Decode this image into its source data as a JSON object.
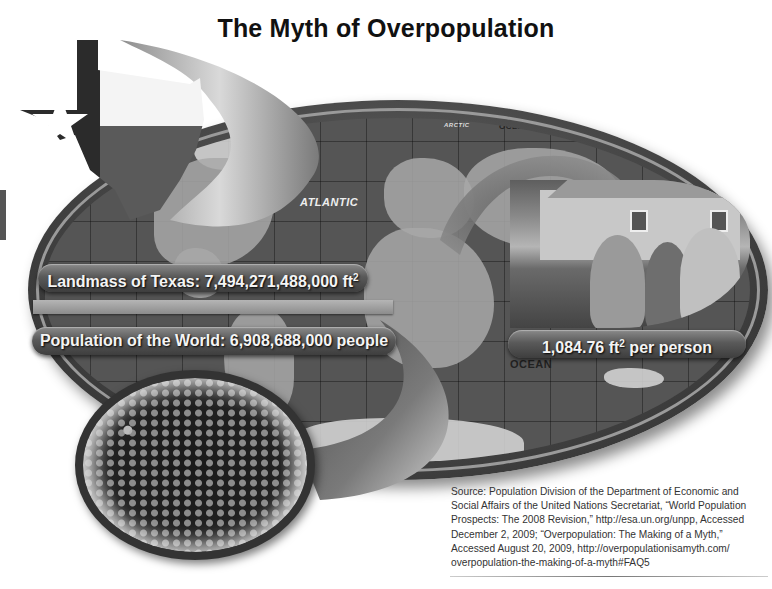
{
  "title": "The Myth of Overpopulation",
  "map": {
    "labels": {
      "atlantic": "ATLANTIC",
      "arctic": "ARCTIC",
      "ocean_top": "OCEAN",
      "ocean_bottom": "OCEAN"
    }
  },
  "labels": {
    "texas_prefix": "Landmass of Texas: 7,494,271,488,000 ft",
    "texas_sup": "2",
    "world_population": "Population of the World: 6,908,688,000 people",
    "per_person_prefix": "1,084.76 ft",
    "per_person_sup": "2",
    "per_person_suffix": " per person"
  },
  "images": {
    "texas": "texas-flag-shape",
    "family": "family-in-front-of-house-photo",
    "crowd": "crowd-aerial-photo",
    "world_map": "world-map"
  },
  "colors": {
    "background": "#ffffff",
    "title": "#111111",
    "pill_top": "#8a8a8a",
    "pill_bottom": "#3e3e3e",
    "pill_text": "#f4f4f4",
    "source_text": "#333333"
  },
  "source": {
    "lines": [
      "Source: Population Division of the Department of Economic and",
      "Social Affairs of the United Nations Secretariat, “World Population",
      "Prospects: The 2008 Revision,” http://esa.un.org/unpp, Accessed",
      "December 2, 2009; “Overpopulation: The Making of a Myth,”",
      "Accessed August 20, 2009, http://overpopulationisamyth.com/",
      "overpopulation-the-making-of-a-myth#FAQ5"
    ]
  }
}
